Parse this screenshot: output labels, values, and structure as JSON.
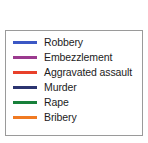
{
  "chart_data": {
    "type": "line",
    "title": "",
    "xlabel": "",
    "ylabel": "",
    "legend_position": "standalone-box",
    "grid": false,
    "series": [
      {
        "name": "Robbery",
        "color": "#3b57c4",
        "values": []
      },
      {
        "name": "Embezzlement",
        "color": "#9b3a8e",
        "values": []
      },
      {
        "name": "Aggravated assault",
        "color": "#e8402a",
        "values": []
      },
      {
        "name": "Murder",
        "color": "#2b3470",
        "values": []
      },
      {
        "name": "Rape",
        "color": "#17803a",
        "values": []
      },
      {
        "name": "Bribery",
        "color": "#f07a22",
        "values": []
      }
    ]
  },
  "legend": {
    "border_color": "#9a9a9a",
    "background_color": "#ffffff",
    "entries": [
      {
        "label": "Robbery",
        "color": "#3b57c4",
        "swatch_name": "legend-swatch-robbery"
      },
      {
        "label": "Embezzlement",
        "color": "#9b3a8e",
        "swatch_name": "legend-swatch-embezzlement"
      },
      {
        "label": "Aggravated assault",
        "color": "#e8402a",
        "swatch_name": "legend-swatch-aggravated-assault"
      },
      {
        "label": "Murder",
        "color": "#2b3470",
        "swatch_name": "legend-swatch-murder"
      },
      {
        "label": "Rape",
        "color": "#17803a",
        "swatch_name": "legend-swatch-rape"
      },
      {
        "label": "Bribery",
        "color": "#f07a22",
        "swatch_name": "legend-swatch-bribery"
      }
    ]
  }
}
